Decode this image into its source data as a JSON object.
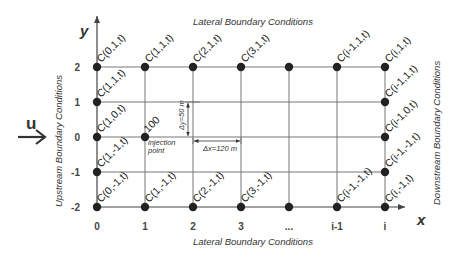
{
  "diagram": {
    "axes": {
      "x_label": "x",
      "y_label": "y"
    },
    "x_ticks": [
      {
        "label": "0",
        "x": 97
      },
      {
        "label": "1",
        "x": 145
      },
      {
        "label": "2",
        "x": 193
      },
      {
        "label": "3",
        "x": 241
      },
      {
        "label": "...",
        "x": 289
      },
      {
        "label": "i-1",
        "x": 337
      },
      {
        "label": "i",
        "x": 385
      }
    ],
    "y_ticks": [
      {
        "label": "2",
        "y": 67
      },
      {
        "label": "1",
        "y": 102
      },
      {
        "label": "0",
        "y": 137
      },
      {
        "label": "-1",
        "y": 172
      },
      {
        "label": "-2",
        "y": 207
      }
    ],
    "boundary_labels": {
      "top": "Lateral Boundary Conditions",
      "bottom": "Lateral Boundary Conditions",
      "left": "Upstream Boundary Conditions",
      "right": "Downstream Boundary Conditions"
    },
    "flow": {
      "label": "u"
    },
    "injection": {
      "value": "100",
      "label_line1": "injection",
      "label_line2": "point"
    },
    "dimensions": {
      "dy": "Δy=50 m",
      "dx": "Δx=120 m"
    },
    "node_labels": [
      {
        "text": "C(0,1,t)",
        "x": 99,
        "y": 63
      },
      {
        "text": "C(1,1,t)",
        "x": 147,
        "y": 63
      },
      {
        "text": "C(2,1,t)",
        "x": 195,
        "y": 63
      },
      {
        "text": "C(3,1,t)",
        "x": 243,
        "y": 63
      },
      {
        "text": "C(i-1,1,t)",
        "x": 339,
        "y": 63
      },
      {
        "text": "C(i,1,t)",
        "x": 387,
        "y": 63
      },
      {
        "text": "C(1,1,t)",
        "x": 99,
        "y": 98
      },
      {
        "text": "C(1,0,t)",
        "x": 99,
        "y": 133
      },
      {
        "text": "C(1,-1,t)",
        "x": 99,
        "y": 168
      },
      {
        "text": "C(0,-1,t)",
        "x": 99,
        "y": 203
      },
      {
        "text": "C(1,-1,t)",
        "x": 147,
        "y": 203
      },
      {
        "text": "C(2,-1,t)",
        "x": 195,
        "y": 203
      },
      {
        "text": "C(3,-1,t)",
        "x": 243,
        "y": 203
      },
      {
        "text": "C(i-1,-1,t)",
        "x": 339,
        "y": 203
      },
      {
        "text": "C(i,-1,t)",
        "x": 387,
        "y": 203
      },
      {
        "text": "C(i-1,1,t)",
        "x": 387,
        "y": 98
      },
      {
        "text": "C(i-1,0,t)",
        "x": 387,
        "y": 133
      },
      {
        "text": "C(i-1,-1,t)",
        "x": 387,
        "y": 168
      }
    ]
  }
}
